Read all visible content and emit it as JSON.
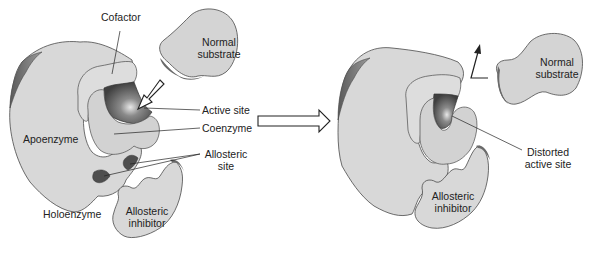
{
  "diagram": {
    "left_panel": {
      "labels": {
        "cofactor": "Cofactor",
        "normal_substrate_line1": "Normal",
        "normal_substrate_line2": "substrate",
        "active_site": "Active site",
        "coenzyme": "Coenzyme",
        "apoenzyme": "Apoenzyme",
        "allosteric_site_line1": "Allosteric",
        "allosteric_site_line2": "site",
        "holoenzyme": "Holoenzyme",
        "allosteric_inhibitor_line1": "Allosteric",
        "allosteric_inhibitor_line2": "inhibitor"
      }
    },
    "transition_arrow": "hollow-right-arrow",
    "right_panel": {
      "labels": {
        "normal_substrate_line1": "Normal",
        "normal_substrate_line2": "substrate",
        "distorted_active_site_line1": "Distorted",
        "distorted_active_site_line2": "active site",
        "allosteric_inhibitor_line1": "Allosteric",
        "allosteric_inhibitor_line2": "inhibitor"
      }
    },
    "colors": {
      "enzyme_fill": "#d6d6d6",
      "enzyme_light": "#e2e2e2",
      "shadow": "#6e6e6e",
      "active_site_dark": "#555555",
      "outline": "#4a4a4a",
      "text": "#222222"
    }
  }
}
